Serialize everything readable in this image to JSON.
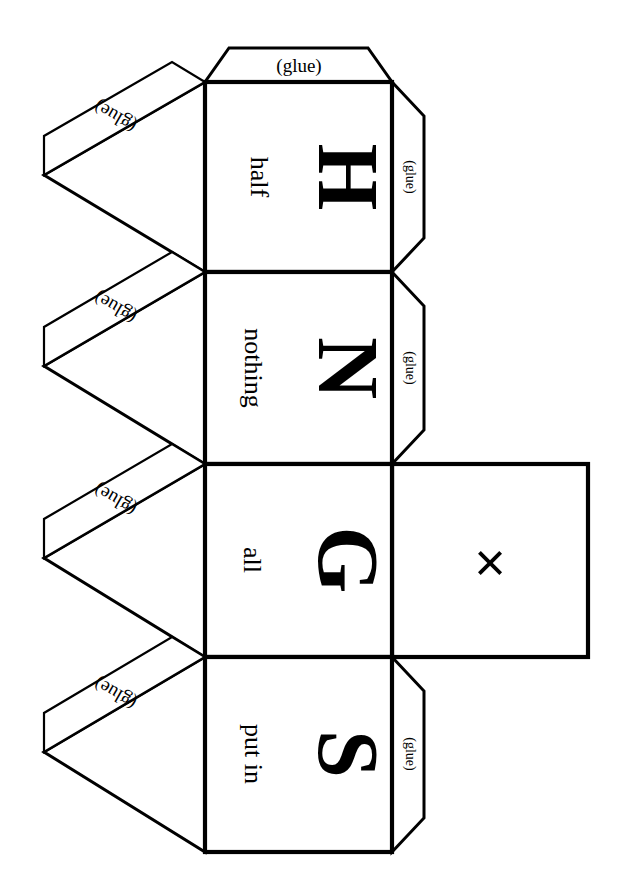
{
  "document": {
    "kind": "papercraft-net",
    "title": "HNGS cube net",
    "background_color": "#ffffff",
    "ink_color": "#000000",
    "width": 617,
    "height": 896
  },
  "faces": [
    {
      "id": "face-h",
      "letter": "H",
      "word": "half",
      "x": 205,
      "y": 82,
      "w": 187,
      "h": 190,
      "letter_cx": 348,
      "letter_cy": 177,
      "word_cx": 259,
      "word_cy": 177
    },
    {
      "id": "face-n",
      "letter": "N",
      "word": "nothing",
      "x": 205,
      "y": 272,
      "w": 187,
      "h": 192,
      "letter_cx": 348,
      "letter_cy": 368,
      "word_cx": 253,
      "word_cy": 368
    },
    {
      "id": "face-g",
      "letter": "G",
      "word": "all",
      "x": 205,
      "y": 464,
      "w": 187,
      "h": 193,
      "letter_cx": 348,
      "letter_cy": 560,
      "word_cx": 252,
      "word_cy": 560
    },
    {
      "id": "face-s",
      "letter": "S",
      "word": "put in",
      "x": 205,
      "y": 657,
      "w": 187,
      "h": 195,
      "letter_cx": 348,
      "letter_cy": 754,
      "word_cx": 253,
      "word_cy": 754
    }
  ],
  "blank_face": {
    "id": "face-x",
    "mark": "×",
    "x": 392,
    "y": 464,
    "w": 196,
    "h": 193,
    "mark_cx": 490,
    "mark_cy": 560
  },
  "glue_flaps": {
    "label": "(glue)",
    "top": {
      "id": "glue-top",
      "points": "205,82 392,82 368,48 229,48",
      "label_cx": 299,
      "label_cy": 67,
      "rotation": 0
    },
    "right": [
      {
        "id": "glue-right-h",
        "points": "392,82 424,116 424,238 392,272",
        "label_cx": 409,
        "label_cy": 177,
        "rotation": 90
      },
      {
        "id": "glue-right-n",
        "points": "392,272 424,306 424,430 392,464",
        "label_cx": 409,
        "label_cy": 368,
        "rotation": 90
      },
      {
        "id": "glue-right-s",
        "points": "392,657 424,691 424,818 392,852",
        "label_cx": 409,
        "label_cy": 754,
        "rotation": 90
      }
    ],
    "left": [
      {
        "id": "glue-left-h",
        "tri_points": "205,82 44,175 205,272",
        "strip_points": "205,82 44,175 44,136 172,62",
        "label_cx": 116,
        "label_cy": 115,
        "rotation": 210
      },
      {
        "id": "glue-left-n",
        "tri_points": "205,272 44,366 205,464",
        "strip_points": "205,272 44,366 44,327 172,252",
        "label_cx": 116,
        "label_cy": 306,
        "rotation": 210
      },
      {
        "id": "glue-left-g",
        "tri_points": "205,464 44,558 205,657",
        "strip_points": "205,464 44,558 44,519 172,444",
        "label_cx": 116,
        "label_cy": 498,
        "rotation": 210
      },
      {
        "id": "glue-left-s",
        "tri_points": "205,657 44,752 205,852",
        "strip_points": "205,657 44,752 44,713 172,637",
        "label_cx": 116,
        "label_cy": 692,
        "rotation": 210
      }
    ]
  }
}
